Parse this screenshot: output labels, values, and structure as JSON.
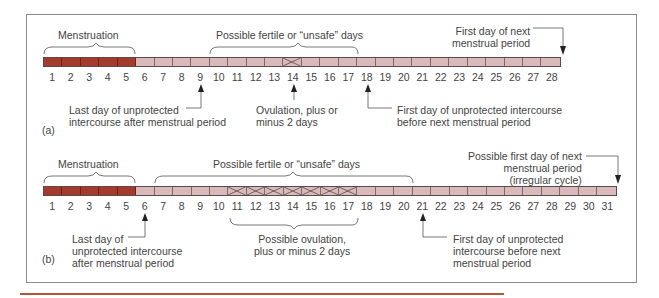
{
  "figure": {
    "panel_a": {
      "label": "(a)",
      "days": [
        "1",
        "2",
        "3",
        "4",
        "5",
        "6",
        "7",
        "8",
        "9",
        "10",
        "11",
        "12",
        "13",
        "14",
        "15",
        "16",
        "17",
        "18",
        "19",
        "20",
        "21",
        "22",
        "23",
        "24",
        "25",
        "26",
        "27",
        "28"
      ],
      "menstruation_days": 5,
      "ovulation_marked_days": [
        14
      ],
      "brackets": {
        "menstruation": "Menstruation",
        "fertile": "Possible fertile or “unsafe” days"
      },
      "annotations": {
        "last_day": [
          "Last day of unprotected",
          "intercourse after menstrual period"
        ],
        "ovulation": [
          "Ovulation, plus or",
          "minus 2 days"
        ],
        "first_day_unprotected": [
          "First day of unprotected intercourse",
          "before next menstrual period"
        ],
        "next_period": [
          "First day of next",
          "menstrual period"
        ]
      }
    },
    "panel_b": {
      "label": "(b)",
      "days": [
        "1",
        "2",
        "3",
        "4",
        "5",
        "6",
        "7",
        "8",
        "9",
        "10",
        "11",
        "12",
        "13",
        "14",
        "15",
        "16",
        "17",
        "18",
        "19",
        "20",
        "21",
        "22",
        "23",
        "24",
        "25",
        "26",
        "27",
        "28",
        "29",
        "30",
        "31"
      ],
      "menstruation_days": 5,
      "ovulation_marked_days": [
        11,
        12,
        13,
        14,
        15,
        16,
        17
      ],
      "brackets": {
        "menstruation": "Menstruation",
        "fertile": "Possible fertile or “unsafe” days",
        "ovulation": [
          "Possible ovulation,",
          "plus or minus 2 days"
        ]
      },
      "annotations": {
        "last_day": [
          "Last day of",
          "unprotected intercourse",
          "after menstrual period"
        ],
        "first_day_unprotected": [
          "First day of unprotected",
          "intercourse before next",
          "menstrual period"
        ],
        "next_period": [
          "Possible first day of next",
          "menstrual period",
          "(irregular cycle)"
        ]
      }
    },
    "colors": {
      "menstruation": "#a33a2c",
      "normal_day": "#d9b9b9",
      "accent_rule": "#b5563c"
    }
  }
}
